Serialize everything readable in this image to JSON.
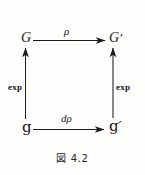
{
  "figure": {
    "caption": "図 4.2",
    "caption_label": "図",
    "caption_number": "4.2",
    "background_color": "#fdfdfc",
    "ink_color": "#1a1a1a"
  },
  "diagram": {
    "type": "commutative-diagram",
    "shape": "square",
    "nodes": [
      {
        "id": "top-left",
        "text": "G",
        "prime": "",
        "position": "top-left"
      },
      {
        "id": "top-right",
        "text": "G",
        "prime": "′",
        "position": "top-right"
      },
      {
        "id": "bottom-left",
        "text": "g",
        "prime": "",
        "position": "bottom-left"
      },
      {
        "id": "bottom-right",
        "text": "g",
        "prime": "′",
        "position": "bottom-right"
      }
    ],
    "arrows": [
      {
        "id": "top",
        "label": "ρ",
        "from": "bottom-left-G",
        "to": "top-right-G-prime",
        "direction": "right"
      },
      {
        "id": "bottom",
        "label": "dρ",
        "from": "g",
        "to": "g-prime",
        "direction": "right"
      },
      {
        "id": "left-vertical",
        "label": "exp",
        "from": "g",
        "to": "G",
        "direction": "up"
      },
      {
        "id": "right-vertical",
        "label": "exp",
        "from": "g-prime",
        "to": "G-prime",
        "direction": "up"
      }
    ]
  }
}
